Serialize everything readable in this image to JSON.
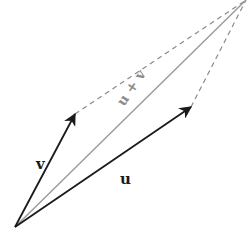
{
  "diagram": {
    "colors": {
      "vector": "#1a1a1a",
      "sum": "#9a9a9a",
      "dashed": "#8a8a8a",
      "sum_label": "#8c8c8c",
      "background": "#ffffff"
    },
    "origin": {
      "x": 15,
      "y": 227
    },
    "vectors": [
      {
        "id": "v",
        "label": "v",
        "tip": {
          "x": 75,
          "y": 114
        },
        "label_pos": {
          "x": 36,
          "y": 169
        }
      },
      {
        "id": "u",
        "label": "u",
        "tip": {
          "x": 191,
          "y": 107
        },
        "label_pos": {
          "x": 120,
          "y": 184
        }
      }
    ],
    "sum": {
      "label": "u + v",
      "tip": {
        "x": 246,
        "y": 0
      },
      "label_pos": {
        "x": 124,
        "y": 107
      },
      "angle": -56
    },
    "dashed_edges": [
      {
        "from": "v_tip",
        "to": "sum_tip"
      },
      {
        "from": "u_tip",
        "to": "sum_tip"
      }
    ]
  }
}
